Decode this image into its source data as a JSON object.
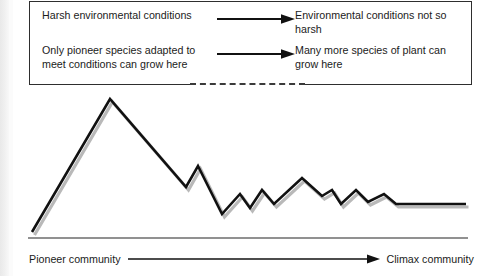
{
  "figure": {
    "callouts": {
      "row1": {
        "left_text": "Harsh environmental conditions",
        "arrow": "right-arrow-icon",
        "right_text": "Environmental conditions not so harsh"
      },
      "row2": {
        "left_text": "Only pioneer species adapted to meet conditions can grow here",
        "arrow": "right-arrow-icon",
        "right_text": "Many more species of plant can grow here"
      }
    },
    "axis": {
      "start_label": "Pioneer community",
      "arrow": "right-arrow-icon",
      "end_label": "Climax community"
    },
    "colors": {
      "ink": "#1b1b1b",
      "line": "#111111",
      "shadow": "#b9b9b9",
      "box_border": "#2e2e2e",
      "background": "#ffffff"
    }
  },
  "chart_data": {
    "type": "line",
    "title": "",
    "xlabel": "Pioneer community → Climax community",
    "ylabel": "",
    "xlim": [
      0,
      492
    ],
    "ylim": [
      0,
      160
    ],
    "grid": false,
    "legend": "none",
    "series": [
      {
        "name": "Rate of change / species turnover during succession",
        "points": [
          [
            32,
            146
          ],
          [
            110,
            13
          ],
          [
            186,
            101
          ],
          [
            198,
            80
          ],
          [
            222,
            128
          ],
          [
            240,
            108
          ],
          [
            250,
            122
          ],
          [
            262,
            104
          ],
          [
            274,
            118
          ],
          [
            302,
            92
          ],
          [
            322,
            110
          ],
          [
            332,
            104
          ],
          [
            341,
            118
          ],
          [
            356,
            104
          ],
          [
            368,
            116
          ],
          [
            384,
            108
          ],
          [
            396,
            118
          ],
          [
            414,
            118
          ],
          [
            466,
            118
          ]
        ]
      }
    ]
  }
}
